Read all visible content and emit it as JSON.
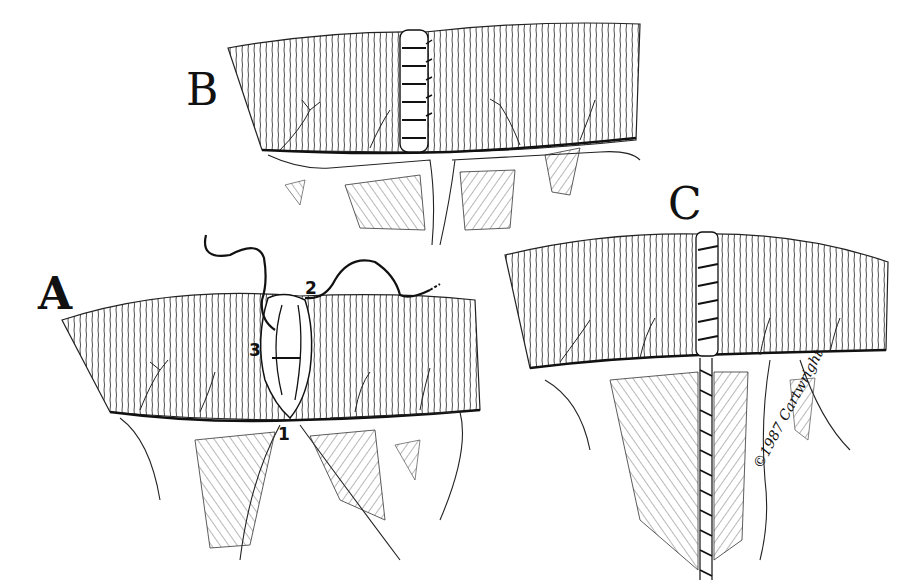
{
  "figure": {
    "panels": [
      {
        "id": "A",
        "label": "A",
        "content": "Bowel ends approximated with stay sutures; numbered suture points",
        "suture_numbers": [
          "1",
          "2",
          "3"
        ]
      },
      {
        "id": "B",
        "label": "B",
        "content": "Completed interrupted serosal suture line across bowel wall"
      },
      {
        "id": "C",
        "label": "C",
        "content": "Completed anastomosis with mesenteric defect closed by running suture"
      }
    ],
    "suture_labels": {
      "one": "1",
      "two": "2",
      "three": "3"
    },
    "signature": "©1987 Cartwright",
    "style": {
      "ink": "#111111",
      "background": "#ffffff"
    }
  }
}
